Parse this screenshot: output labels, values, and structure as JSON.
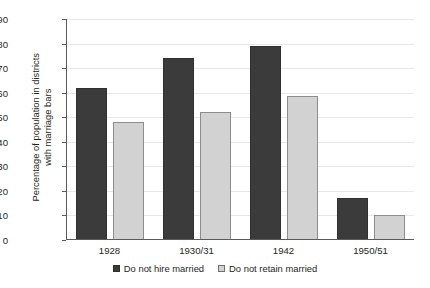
{
  "chart_data": {
    "type": "bar",
    "title": "",
    "xlabel": "",
    "ylabel": "Percentage of population in districts with marriage bars",
    "ylabel_line1": "Percentage of population in districts",
    "ylabel_line2": "with marriage bars",
    "categories": [
      "1928",
      "1930/31",
      "1942",
      "1950/51"
    ],
    "series": [
      {
        "name": "Do not hire married",
        "color": "#3b3b3b",
        "values": [
          62,
          74,
          79,
          17
        ]
      },
      {
        "name": "Do not retain married",
        "color": "#d2d2d2",
        "values": [
          48,
          52,
          58.5,
          10
        ]
      }
    ],
    "ylim": [
      0,
      90
    ],
    "ytick_values": [
      0,
      10,
      20,
      30,
      40,
      50,
      60,
      70,
      80,
      90
    ],
    "ytick_labels": [
      "0",
      "10",
      "20",
      "30",
      "40",
      "50",
      "60",
      "70",
      "80",
      "90"
    ],
    "grid": true,
    "legend_position": "bottom-center"
  },
  "legend": {
    "items": [
      {
        "label": "Do not hire married",
        "swatch": "dark"
      },
      {
        "label": "Do not retain married",
        "swatch": "light"
      }
    ]
  }
}
